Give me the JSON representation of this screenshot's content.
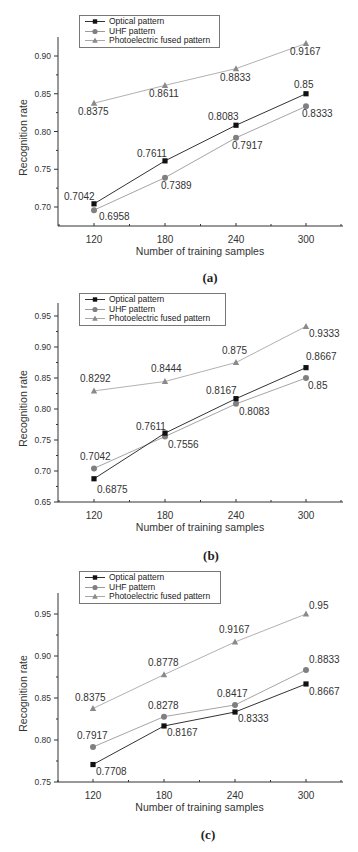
{
  "figure": {
    "panels": [
      {
        "caption": "(a)",
        "legend": [
          "Optical pattern",
          "UHF pattern",
          "Photoelectric fused pattern"
        ]
      },
      {
        "caption": "(b)",
        "legend": [
          "Optical pattern",
          "UHF pattern",
          "Photoelectric fused pattern"
        ]
      },
      {
        "caption": "(c)",
        "legend": [
          "Optical pattern",
          "UHF pattern",
          "Photoelectric fused pattern"
        ]
      }
    ]
  },
  "colors": {
    "optical": "#111111",
    "uhf": "#808080",
    "fused": "#8a8a8a",
    "optical_line": "#333333",
    "uhf_line": "#9a9a9a",
    "fused_line": "#a8a8a8",
    "axis": "#333333"
  },
  "chart_data": [
    {
      "type": "line",
      "title": "(a)",
      "xlabel": "Number of training samples",
      "ylabel": "Recognition rate",
      "categories": [
        "120",
        "180",
        "240",
        "300"
      ],
      "x": [
        120,
        180,
        240,
        300
      ],
      "ylim": [
        0.675,
        0.925
      ],
      "yticks": [
        "0.70",
        "0.75",
        "0.80",
        "0.85",
        "0.90"
      ],
      "grid": false,
      "legend_position": "top-left",
      "series": [
        {
          "name": "Optical pattern",
          "marker": "square",
          "values": [
            0.7042,
            0.7611,
            0.8083,
            0.85
          ],
          "labels": [
            "0.7042",
            "0.7611",
            "0.8083",
            "0.85"
          ]
        },
        {
          "name": "UHF pattern",
          "marker": "circle",
          "values": [
            0.6958,
            0.7389,
            0.7917,
            0.8333
          ],
          "labels": [
            "0.6958",
            "0.7389",
            "0.7917",
            "0.8333"
          ]
        },
        {
          "name": "Photoelectric fused pattern",
          "marker": "triangle",
          "values": [
            0.8375,
            0.8611,
            0.8833,
            0.9167
          ],
          "labels": [
            "0.8375",
            "0.8611",
            "0.8833",
            "0.9167"
          ]
        }
      ]
    },
    {
      "type": "line",
      "title": "(b)",
      "xlabel": "Number of training samples",
      "ylabel": "Recognition rate",
      "categories": [
        "120",
        "180",
        "240",
        "300"
      ],
      "x": [
        120,
        180,
        240,
        300
      ],
      "ylim": [
        0.65,
        0.97
      ],
      "yticks": [
        "0.65",
        "0.70",
        "0.75",
        "0.80",
        "0.85",
        "0.90",
        "0.95"
      ],
      "grid": false,
      "legend_position": "top-left",
      "series": [
        {
          "name": "Optical pattern",
          "marker": "square",
          "values": [
            0.6875,
            0.7611,
            0.8167,
            0.8667
          ],
          "labels": [
            "0.6875",
            "0.7611",
            "0.8167",
            "0.8667"
          ]
        },
        {
          "name": "UHF pattern",
          "marker": "circle",
          "values": [
            0.7042,
            0.7556,
            0.8083,
            0.85
          ],
          "labels": [
            "0.7042",
            "0.7556",
            "0.8083",
            "0.85"
          ]
        },
        {
          "name": "Photoelectric fused pattern",
          "marker": "triangle",
          "values": [
            0.8292,
            0.8444,
            0.875,
            0.9333
          ],
          "labels": [
            "0.8292",
            "0.8444",
            "0.875",
            "0.9333"
          ]
        }
      ]
    },
    {
      "type": "line",
      "title": "(c)",
      "xlabel": "Number of training samples",
      "ylabel": "Recognition rate",
      "categories": [
        "120",
        "180",
        "240",
        "300"
      ],
      "x": [
        120,
        180,
        240,
        300
      ],
      "ylim": [
        0.75,
        0.975
      ],
      "yticks": [
        "0.75",
        "0.80",
        "0.85",
        "0.90",
        "0.95"
      ],
      "grid": false,
      "legend_position": "top-left",
      "series": [
        {
          "name": "Optical pattern",
          "marker": "square",
          "values": [
            0.7708,
            0.8167,
            0.8333,
            0.8667
          ],
          "labels": [
            "0.7708",
            "0.8167",
            "0.8333",
            "0.8667"
          ]
        },
        {
          "name": "UHF pattern",
          "marker": "circle",
          "values": [
            0.7917,
            0.8278,
            0.8417,
            0.8833
          ],
          "labels": [
            "0.7917",
            "0.8278",
            "0.8417",
            "0.8833"
          ]
        },
        {
          "name": "Photoelectric fused pattern",
          "marker": "triangle",
          "values": [
            0.8375,
            0.8778,
            0.9167,
            0.95
          ],
          "labels": [
            "0.8375",
            "0.8778",
            "0.9167",
            "0.95"
          ]
        }
      ]
    }
  ]
}
